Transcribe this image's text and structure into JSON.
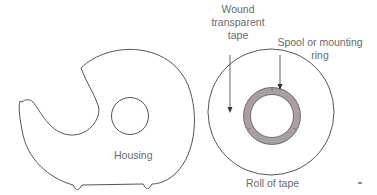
{
  "figure": {
    "housing": {
      "label": "Housing",
      "stroke_color": "#555555"
    },
    "roll": {
      "label": "Roll of tape",
      "stroke_color": "#555555"
    },
    "callouts": {
      "wound_tape": {
        "lines": [
          "Wound",
          "transparent",
          "tape"
        ]
      },
      "spool": {
        "lines": [
          "Spool or mounting",
          "ring"
        ]
      }
    },
    "colors": {
      "spool_fill": "#a89fa3",
      "line": "#555555",
      "text": "#6a6a6a"
    },
    "corner_mark": "="
  }
}
